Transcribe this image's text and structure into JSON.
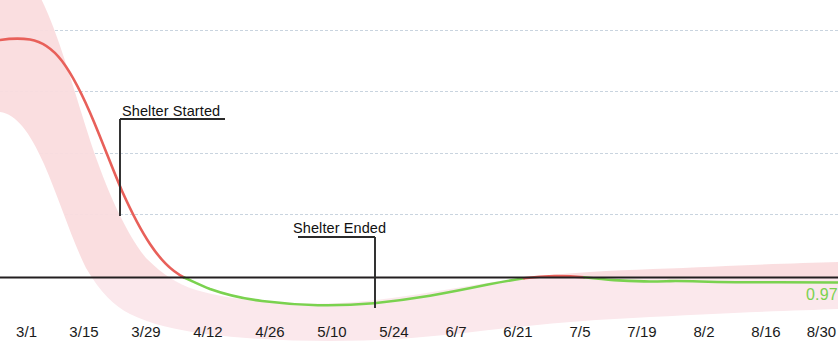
{
  "chart_data": {
    "type": "line",
    "title": "",
    "subtitle": "",
    "xlabel": "",
    "ylabel": "",
    "grid": true,
    "legend_position": "none",
    "x_tick_labels": [
      "3/1",
      "3/15",
      "3/29",
      "4/12",
      "4/26",
      "5/10",
      "5/24",
      "6/7",
      "6/21",
      "7/5",
      "7/19",
      "8/2",
      "8/16",
      "8/30"
    ],
    "baseline_value": 1.0,
    "y_gridline_values": [
      2.0,
      1.75,
      1.5,
      1.25
    ],
    "ylim": [
      0.75,
      2.15
    ],
    "series": [
      {
        "name": "Rt estimate",
        "x": [
          "3/1",
          "3/5",
          "3/9",
          "3/13",
          "3/17",
          "3/21",
          "3/25",
          "3/29",
          "4/2",
          "4/6",
          "4/12",
          "4/18",
          "4/26",
          "5/4",
          "5/10",
          "5/17",
          "5/24",
          "5/31",
          "6/7",
          "6/14",
          "6/21",
          "6/28",
          "7/5",
          "7/12",
          "7/19",
          "7/26",
          "8/2",
          "8/9",
          "8/16",
          "8/23",
          "8/30"
        ],
        "values": [
          2.02,
          2.01,
          1.97,
          1.88,
          1.75,
          1.6,
          1.45,
          1.3,
          1.18,
          1.1,
          1.0,
          0.955,
          0.925,
          0.912,
          0.908,
          0.915,
          0.925,
          0.945,
          0.962,
          0.982,
          0.999,
          1.006,
          1.004,
          0.995,
          0.988,
          0.985,
          0.983,
          0.98,
          0.978,
          0.975,
          0.97
        ],
        "final_value": "0.97"
      }
    ],
    "confidence_band": {
      "name": "credible interval",
      "upper": [
        2.15,
        2.14,
        2.11,
        2.04,
        1.93,
        1.79,
        1.64,
        1.49,
        1.35,
        1.25,
        1.11,
        1.04,
        0.99,
        0.965,
        0.958,
        0.962,
        0.972,
        0.99,
        1.005,
        1.02,
        1.035,
        1.04,
        1.038,
        1.03,
        1.025,
        1.022,
        1.02,
        1.018,
        1.016,
        1.014,
        1.012
      ],
      "lower": [
        1.88,
        1.87,
        1.84,
        1.74,
        1.59,
        1.43,
        1.28,
        1.13,
        1.02,
        0.96,
        0.9,
        0.875,
        0.862,
        0.858,
        0.856,
        0.862,
        0.874,
        0.898,
        0.918,
        0.942,
        0.962,
        0.97,
        0.968,
        0.96,
        0.952,
        0.948,
        0.946,
        0.943,
        0.94,
        0.937,
        0.932
      ]
    },
    "annotations": [
      {
        "id": "shelter-started",
        "label": "Shelter Started",
        "x_position_px": 120,
        "label_top_px": 103,
        "leader_from_y_px": 118,
        "leader_to_y_px": 216
      },
      {
        "id": "shelter-ended",
        "label": "Shelter Ended",
        "x_position_px": 375,
        "label_top_px": 220,
        "leader_from_y_px": 237,
        "leader_to_y_px": 308
      }
    ],
    "colors": {
      "above_threshold": "#e8605a",
      "below_threshold": "#7ad24f",
      "band_above": "#f9d9da",
      "band_below": "#f7e2e8",
      "baseline": "#231f20",
      "gridline": "#c9d4df",
      "annotation": "#2a2a2a",
      "tick_label": "#1a1a1a",
      "end_value_label": "#7ad24f"
    }
  },
  "end_value": {
    "text": "0.97"
  },
  "x_tick_positions_px": [
    22,
    84,
    146,
    208,
    270,
    332,
    394,
    456,
    518,
    580,
    642,
    704,
    766,
    828
  ]
}
